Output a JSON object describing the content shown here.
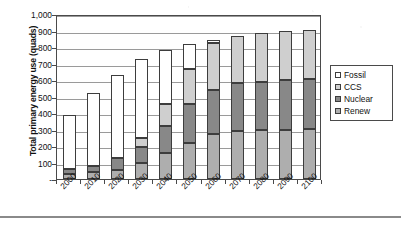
{
  "chart_data": {
    "type": "bar",
    "stacked": true,
    "title": "",
    "xlabel": "",
    "ylabel": "Total primary energy use (quads)",
    "categories": [
      "2000",
      "2010",
      "2020",
      "2030",
      "2040",
      "2050",
      "2060",
      "2070",
      "2080",
      "2090",
      "2100"
    ],
    "series": [
      {
        "name": "Renew",
        "values": [
          30,
          40,
          55,
          95,
          160,
          220,
          270,
          293,
          295,
          300,
          305
        ]
      },
      {
        "name": "Nuclear",
        "values": [
          30,
          40,
          75,
          100,
          160,
          235,
          270,
          287,
          295,
          300,
          300
        ]
      },
      {
        "name": "CCS",
        "values": [
          0,
          0,
          0,
          53,
          135,
          210,
          285,
          285,
          295,
          295,
          300
        ]
      },
      {
        "name": "Fossil",
        "values": [
          330,
          440,
          500,
          482,
          330,
          155,
          20,
          0,
          0,
          0,
          0
        ]
      }
    ],
    "totals": [
      390,
      520,
      630,
      730,
      785,
      820,
      845,
      865,
      885,
      895,
      905
    ],
    "stack_order_bottom_to_top": [
      "Renew",
      "Nuclear",
      "CCS",
      "Fossil"
    ],
    "ylim": [
      0,
      1000
    ],
    "ytick_values": [
      0,
      100,
      200,
      300,
      400,
      500,
      600,
      700,
      800,
      900,
      1000
    ],
    "ytick_labels": [
      "-",
      "100",
      "200",
      "300",
      "400",
      "500",
      "600",
      "700",
      "800",
      "900",
      "1,000"
    ],
    "grid": true,
    "grid_axis": "y",
    "legend_position": "right",
    "legend": [
      {
        "label": "Fossil",
        "color": "#ffffff"
      },
      {
        "label": "CCS",
        "color": "#cfcfcf"
      },
      {
        "label": "Nuclear",
        "color": "#888888"
      },
      {
        "label": "Renew",
        "color": "#aeaeae"
      }
    ]
  },
  "colors": {
    "fossil": "#ffffff",
    "ccs": "#cfcfcf",
    "nuclear": "#888888",
    "renew": "#aeaeae",
    "axis": "#4a4a4a",
    "grid": "#9a9a9a",
    "text": "#111111"
  }
}
